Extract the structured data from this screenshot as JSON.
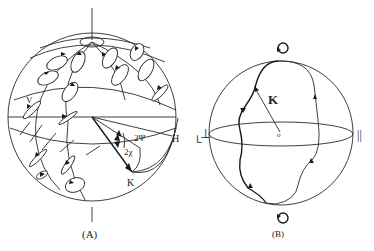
{
  "figure": {
    "panels": [
      {
        "id": "A",
        "caption": "(A)",
        "labels": {
          "vertical": "V",
          "horizontal": "H",
          "azimuth_angle": "2Ψ",
          "ellipticity_angle": "2χ",
          "vector": "K",
          "right_mark": "└"
        },
        "description": "Poincaré sphere with polarization ellipses at various latitudes and longitudes; vector K defined by angles 2Ψ and 2χ"
      },
      {
        "id": "B",
        "caption": "(B)",
        "labels": {
          "vector": "K",
          "origin": "o",
          "left_pole": "⊥",
          "right_pole": "||",
          "top_symbol": "↺",
          "bottom_symbol": "↻"
        },
        "description": "Poincaré sphere with trajectory of polarization state between circular poles"
      }
    ],
    "colors": {
      "line": "#2a2a2a",
      "background": "#ffffff"
    }
  }
}
